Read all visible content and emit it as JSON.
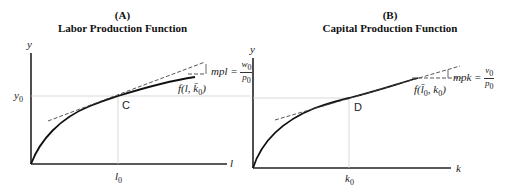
{
  "panels": [
    {
      "id": "A",
      "letter": "(A)",
      "title": "Labor Production Function",
      "y_axis_label": "y",
      "x_axis_label": "l",
      "y_tick": "y0",
      "x_tick": "l0",
      "point_label": "C",
      "curve_label": "f(l, k̄0)",
      "slope_label": "mpl",
      "slope_num": "w0",
      "slope_den": "p0"
    },
    {
      "id": "B",
      "letter": "(B)",
      "title": "Capital Production Function",
      "y_axis_label": "y",
      "x_axis_label": "k",
      "x_tick": "k0",
      "point_label": "D",
      "curve_label": "f(l̄0, k0)",
      "slope_label": "mpk",
      "slope_num": "v0",
      "slope_den": "p0"
    }
  ],
  "colors": {
    "axis": "#222222",
    "curve": "#111111",
    "guide": "#cccccc",
    "dash": "#444444"
  }
}
